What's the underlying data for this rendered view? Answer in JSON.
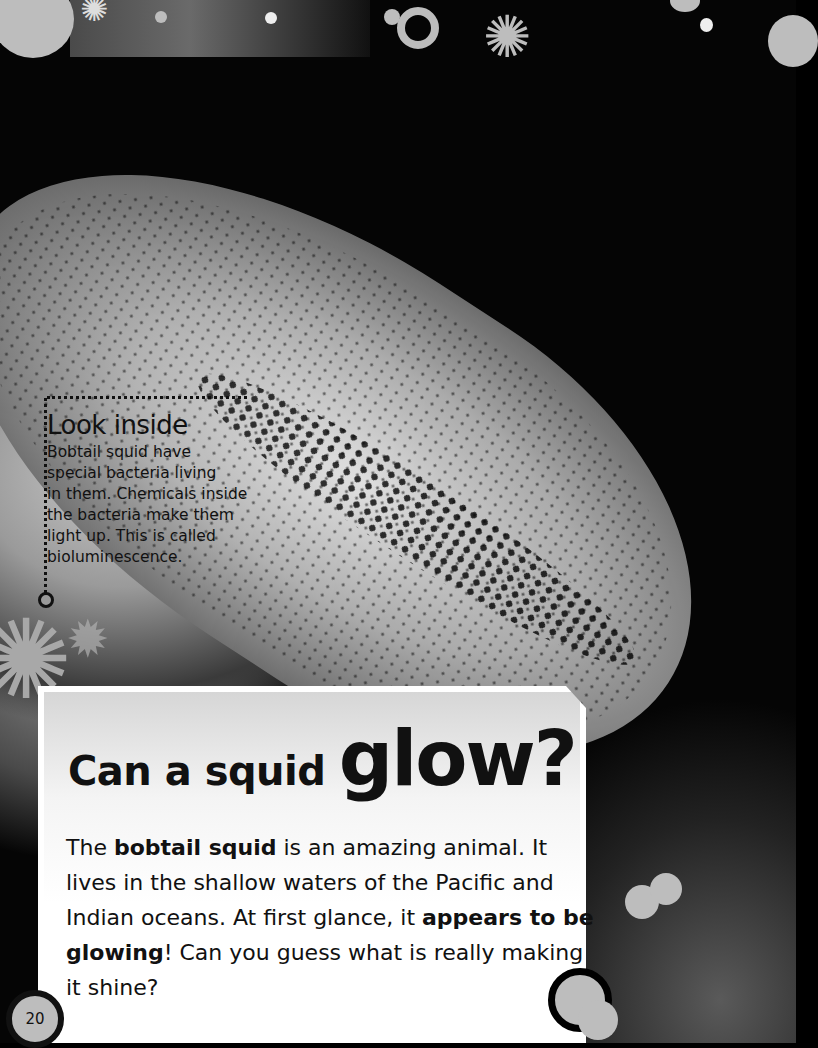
{
  "sidebar_box": {
    "title": "Look inside",
    "lines": [
      "Bobtail squid have",
      "special bacteria living",
      "in them. Chemicals inside",
      "the bacteria make them",
      "light up. This is called",
      "bioluminescence."
    ]
  },
  "main_card": {
    "title_small": "Can a squid ",
    "title_big": "glow?",
    "body": [
      {
        "text": "The ",
        "bold": false
      },
      {
        "text": "bobtail squid",
        "bold": true
      },
      {
        "text": " is an amazing animal. It lives in the shallow waters of the Pacific and Indian oceans. At first glance, it ",
        "bold": false
      },
      {
        "text": "appears to be glowing",
        "bold": true
      },
      {
        "text": "! Can you guess what is really making it shine?",
        "bold": false
      }
    ]
  },
  "page_number": "20",
  "colors": {
    "background": "#000000",
    "accent_gray": "#bdbdbd",
    "card": "#ffffff",
    "text": "#111111"
  },
  "icons": [
    "bubble-circle",
    "ring-icon",
    "germ-icon",
    "double-bubble-icon"
  ]
}
